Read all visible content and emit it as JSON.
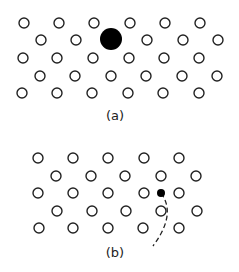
{
  "panels": [
    {
      "label": "(a)",
      "label_pos": [
        115,
        120
      ],
      "open_atoms": [
        [
          24,
          23
        ],
        [
          59,
          23
        ],
        [
          94,
          23
        ],
        [
          130,
          23
        ],
        [
          165,
          23
        ],
        [
          200,
          23
        ],
        [
          41,
          40
        ],
        [
          76,
          40
        ],
        [
          147,
          40
        ],
        [
          183,
          40
        ],
        [
          218,
          40
        ],
        [
          23,
          58
        ],
        [
          57,
          58
        ],
        [
          93,
          58
        ],
        [
          129,
          58
        ],
        [
          164,
          58
        ],
        [
          199,
          58
        ],
        [
          40,
          76
        ],
        [
          75,
          76
        ],
        [
          111,
          76
        ],
        [
          146,
          76
        ],
        [
          182,
          76
        ],
        [
          217,
          76
        ],
        [
          22,
          93
        ],
        [
          57,
          93
        ],
        [
          92,
          93
        ],
        [
          128,
          93
        ],
        [
          163,
          93
        ],
        [
          199,
          93
        ]
      ],
      "filled_atoms": [
        {
          "x": 111,
          "y": 39,
          "r": 11,
          "desc": "large substitutional atom"
        }
      ]
    },
    {
      "label": "(b)",
      "label_pos": [
        115,
        257
      ],
      "open_atoms": [
        [
          38,
          158
        ],
        [
          73,
          158
        ],
        [
          108,
          158
        ],
        [
          144,
          158
        ],
        [
          179,
          158
        ],
        [
          56,
          176
        ],
        [
          91,
          176
        ],
        [
          125,
          176
        ],
        [
          161,
          176
        ],
        [
          196,
          176
        ],
        [
          38,
          193
        ],
        [
          73,
          193
        ],
        [
          108,
          193
        ],
        [
          144,
          193
        ],
        [
          179,
          193
        ],
        [
          57,
          211
        ],
        [
          92,
          211
        ],
        [
          126,
          211
        ],
        [
          161,
          211
        ],
        [
          197,
          211
        ],
        [
          39,
          228
        ],
        [
          73,
          228
        ],
        [
          108,
          228
        ],
        [
          143,
          228
        ],
        [
          179,
          228
        ]
      ],
      "filled_atoms": [
        {
          "x": 161,
          "y": 193,
          "r": 4,
          "desc": "small interstitial atom"
        }
      ],
      "path": {
        "style": "dashed",
        "d": "M161,193 C170,205 171,222 153,246"
      }
    }
  ],
  "style": {
    "open_radius": 5,
    "stroke": "#222222",
    "fill_dark": "#000000"
  }
}
